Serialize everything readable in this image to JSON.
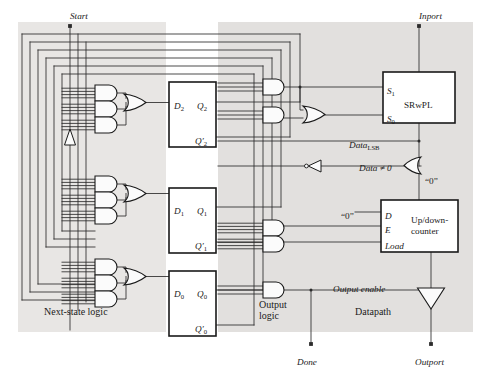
{
  "figure": {
    "type": "digital-logic-block-diagram",
    "caption": ""
  },
  "colors": {
    "wire": "#2b2b2b",
    "box_border": "#1a1a1a",
    "shade_light": "#e8e6e4",
    "shade_mid": "#e2e0de",
    "background": "#ffffff",
    "text": "#1a1a1a",
    "gate_fill": "#fbfbfb"
  },
  "regions": [
    {
      "id": "next-state-logic",
      "label": "Next-state logic",
      "x": 18,
      "y": 22,
      "w": 148,
      "h": 310
    },
    {
      "id": "state-register",
      "label": "",
      "x": 166,
      "y": 22,
      "w": 52,
      "h": 310
    },
    {
      "id": "output-logic",
      "label": "Output logic",
      "x": 218,
      "y": 22,
      "w": 100,
      "h": 310
    },
    {
      "id": "datapath",
      "label": "Datapath",
      "x": 318,
      "y": 22,
      "w": 155,
      "h": 310
    }
  ],
  "region_labels": [
    {
      "text": "Next-state logic",
      "x": 44,
      "y": 307
    },
    {
      "text": "Output logic",
      "x": 259,
      "y": 300,
      "lines": [
        "Output",
        "logic"
      ]
    },
    {
      "text": "Datapath",
      "x": 355,
      "y": 307
    }
  ],
  "ports": [
    {
      "name": "Start",
      "label": "Start",
      "x": 70,
      "y": 12,
      "dot_x": 70,
      "dot_y": 26,
      "kind": "input-top"
    },
    {
      "name": "Inport",
      "label": "Inport",
      "x": 419,
      "y": 12,
      "dot_x": 419,
      "dot_y": 26,
      "kind": "input-top"
    },
    {
      "name": "Done",
      "label": "Done",
      "x": 297,
      "y": 358,
      "dot_x": 311,
      "dot_y": 344,
      "kind": "output-bottom"
    },
    {
      "name": "Outport",
      "label": "Outport",
      "x": 415,
      "y": 358,
      "dot_x": 431,
      "dot_y": 344,
      "kind": "output-bottom"
    }
  ],
  "blocks": [
    {
      "id": "ff2",
      "kind": "flip-flop",
      "x": 169,
      "y": 82,
      "w": 47,
      "h": 65,
      "pins": [
        {
          "text": "D",
          "sub": "2",
          "x": 174,
          "y": 102,
          "side": "left-in"
        },
        {
          "text": "Q",
          "sub": "2",
          "x": 197,
          "y": 102,
          "side": "right-out"
        },
        {
          "text": "Q",
          "sub": "2",
          "prime": true,
          "x": 195,
          "y": 137,
          "side": "right-out"
        }
      ]
    },
    {
      "id": "ff1",
      "kind": "flip-flop",
      "x": 169,
      "y": 188,
      "w": 47,
      "h": 65,
      "pins": [
        {
          "text": "D",
          "sub": "1",
          "x": 174,
          "y": 207,
          "side": "left-in"
        },
        {
          "text": "Q",
          "sub": "1",
          "x": 197,
          "y": 207,
          "side": "right-out"
        },
        {
          "text": "Q",
          "sub": "1",
          "prime": true,
          "x": 195,
          "y": 242,
          "side": "right-out"
        }
      ]
    },
    {
      "id": "ff0",
      "kind": "flip-flop",
      "x": 169,
      "y": 271,
      "w": 47,
      "h": 65,
      "pins": [
        {
          "text": "D",
          "sub": "0",
          "x": 174,
          "y": 290,
          "side": "left-in"
        },
        {
          "text": "Q",
          "sub": "0",
          "x": 197,
          "y": 290,
          "side": "right-out"
        },
        {
          "text": "Q",
          "sub": "0",
          "prime": true,
          "x": 195,
          "y": 325,
          "side": "right-out"
        }
      ]
    },
    {
      "id": "srwpl",
      "kind": "register",
      "label": "SRwPL",
      "x": 383,
      "y": 72,
      "w": 72,
      "h": 51,
      "label_x": 404,
      "label_y": 101,
      "pins": [
        {
          "text": "S",
          "sub": "1",
          "x": 387,
          "y": 87,
          "side": "left-in"
        },
        {
          "text": "S",
          "sub": "0",
          "x": 387,
          "y": 115,
          "side": "left-in"
        }
      ]
    },
    {
      "id": "updown-counter",
      "kind": "counter",
      "label": "Up/down-counter",
      "label_lines": [
        "Up/down-",
        "counter"
      ],
      "x": 381,
      "y": 200,
      "w": 77,
      "h": 52,
      "label_x": 411,
      "label_y": 216,
      "pins": [
        {
          "text": "D",
          "x": 385,
          "y": 212,
          "side": "left-in"
        },
        {
          "text": "E",
          "x": 385,
          "y": 226,
          "side": "left-in"
        },
        {
          "text": "Load",
          "x": 385,
          "y": 242,
          "side": "left-in"
        }
      ]
    }
  ],
  "signal_labels": [
    {
      "id": "data-lsb",
      "text": "Data",
      "sub": "LSB",
      "x": 349,
      "y": 141,
      "italic": true
    },
    {
      "id": "data-nonzero",
      "text": "Data ≠ 0",
      "x": 359,
      "y": 164,
      "italic": true
    },
    {
      "id": "const-zero-or",
      "text": "“0”",
      "x": 425,
      "y": 177,
      "italic": false
    },
    {
      "id": "const-zero-d",
      "text": "“0”",
      "x": 341,
      "y": 212,
      "italic": false
    },
    {
      "id": "output-enable",
      "text": "Output enable",
      "x": 333,
      "y": 285,
      "italic": true
    }
  ],
  "gate_groups": [
    {
      "id": "ns-logic-2",
      "and_gates": [
        {
          "x": 95,
          "y": 85,
          "w": 22,
          "h": 16,
          "inputs": 4
        },
        {
          "x": 95,
          "y": 101,
          "w": 22,
          "h": 16,
          "inputs": 4
        },
        {
          "x": 95,
          "y": 117,
          "w": 22,
          "h": 16,
          "inputs": 4
        }
      ],
      "or_gate": {
        "x": 124,
        "y": 94,
        "w": 22,
        "h": 17
      },
      "feeds": "ff2"
    },
    {
      "id": "ns-logic-1",
      "and_gates": [
        {
          "x": 95,
          "y": 176,
          "w": 22,
          "h": 16,
          "inputs": 4
        },
        {
          "x": 95,
          "y": 192,
          "w": 22,
          "h": 16,
          "inputs": 4
        },
        {
          "x": 95,
          "y": 208,
          "w": 22,
          "h": 16,
          "inputs": 4
        }
      ],
      "or_gate": {
        "x": 124,
        "y": 185,
        "w": 22,
        "h": 17
      },
      "feeds": "ff1"
    },
    {
      "id": "ns-logic-0",
      "and_gates": [
        {
          "x": 95,
          "y": 259,
          "w": 22,
          "h": 16,
          "inputs": 4
        },
        {
          "x": 95,
          "y": 275,
          "w": 22,
          "h": 16,
          "inputs": 4
        },
        {
          "x": 95,
          "y": 291,
          "w": 22,
          "h": 16,
          "inputs": 4
        }
      ],
      "or_gate": {
        "x": 124,
        "y": 268,
        "w": 22,
        "h": 17
      },
      "feeds": "ff0"
    }
  ],
  "output_gates": [
    {
      "id": "out-and-s1",
      "kind": "and",
      "x": 263,
      "y": 79,
      "w": 21,
      "h": 16,
      "inputs": 3,
      "drives": "S1"
    },
    {
      "id": "out-and-s0a",
      "kind": "and",
      "x": 263,
      "y": 107,
      "w": 21,
      "h": 16,
      "inputs": 3,
      "drives": "S0"
    },
    {
      "id": "out-or-s0",
      "kind": "or",
      "x": 303,
      "y": 106,
      "w": 22,
      "h": 17,
      "inputs": 2,
      "drives": "S0"
    },
    {
      "id": "out-and-e",
      "kind": "and",
      "x": 263,
      "y": 220,
      "w": 21,
      "h": 16,
      "inputs": 4,
      "drives": "E"
    },
    {
      "id": "out-and-load",
      "kind": "and",
      "x": 263,
      "y": 236,
      "w": 21,
      "h": 16,
      "inputs": 4,
      "drives": "Load"
    },
    {
      "id": "out-and-oe",
      "kind": "and",
      "x": 263,
      "y": 282,
      "w": 21,
      "h": 16,
      "inputs": 3,
      "drives": "Output enable"
    }
  ],
  "misc_symbols": [
    {
      "id": "start-buffer",
      "kind": "buffer-up",
      "x": 70,
      "y": 129,
      "w": 12,
      "h": 16
    },
    {
      "id": "data-inverter",
      "kind": "inverter-left",
      "x": 305,
      "y": 160,
      "w": 16,
      "h": 12
    },
    {
      "id": "data-or-gate",
      "kind": "or-left",
      "x": 404,
      "y": 157,
      "w": 17,
      "h": 17
    },
    {
      "id": "outport-tristate",
      "kind": "tristate-down",
      "x": 418,
      "y": 288,
      "w": 28,
      "h": 22
    }
  ]
}
